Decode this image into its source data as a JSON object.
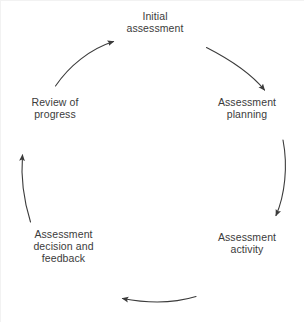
{
  "diagram": {
    "type": "cycle",
    "direction": "clockwise",
    "background_color": "#ffffff",
    "text_color": "#3b3b3b",
    "arrow_color": "#3b3b3b",
    "stages": [
      {
        "id": "initial-assessment",
        "label": "Initial\nassessment",
        "position": "top",
        "order": 1
      },
      {
        "id": "assessment-planning",
        "label": "Assessment\nplanning",
        "position": "right-upper",
        "order": 2
      },
      {
        "id": "assessment-activity",
        "label": "Assessment\nactivity",
        "position": "right-lower",
        "order": 3
      },
      {
        "id": "assessment-decision-and-feedback",
        "label": "Assessment\ndecision and\nfeedback",
        "position": "left-lower",
        "order": 4
      },
      {
        "id": "review-of-progress",
        "label": "Review of\nprogress",
        "position": "left-upper",
        "order": 5
      }
    ],
    "arrows": [
      {
        "id": "arrow-initial-to-planning",
        "from": "initial-assessment",
        "to": "assessment-planning",
        "shape": "curved-arc",
        "head": "filled-triangle"
      },
      {
        "id": "arrow-planning-to-activity",
        "from": "assessment-planning",
        "to": "assessment-activity",
        "shape": "curved-arc",
        "head": "filled-triangle"
      },
      {
        "id": "arrow-activity-to-decision",
        "from": "assessment-activity",
        "to": "assessment-decision-and-feedback",
        "shape": "curved-arc",
        "head": "filled-triangle"
      },
      {
        "id": "arrow-decision-to-review",
        "from": "assessment-decision-and-feedback",
        "to": "review-of-progress",
        "shape": "curved-arc",
        "head": "filled-triangle"
      },
      {
        "id": "arrow-review-to-initial",
        "from": "review-of-progress",
        "to": "initial-assessment",
        "shape": "curved-arc",
        "head": "filled-triangle"
      }
    ]
  }
}
